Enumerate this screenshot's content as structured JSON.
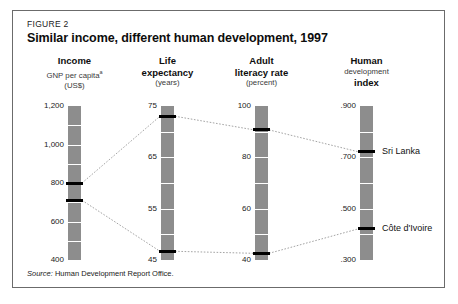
{
  "figure": {
    "label": "FIGURE 2",
    "title": "Similar income, different human development, 1997",
    "source_prefix": "Source:",
    "source_text": "Human Development Report Office."
  },
  "columns": [
    {
      "id": "income",
      "head_main": "Income",
      "head_sub": "GNP per capita",
      "head_sub_marker": "a",
      "head_unit": "(US$)",
      "ticks": [
        "1,200",
        "1,000",
        "800",
        "600",
        "400"
      ],
      "tick_values": [
        1200,
        1000,
        800,
        600,
        400
      ]
    },
    {
      "id": "life-expectancy",
      "head_main": "Life",
      "head_sub": "expectancy",
      "head_sub_marker": "",
      "head_unit": "(years)",
      "ticks": [
        "75",
        "65",
        "55",
        "45"
      ],
      "tick_values": [
        75,
        65,
        55,
        45
      ]
    },
    {
      "id": "adult-literacy",
      "head_main": "Adult",
      "head_sub": "literacy rate",
      "head_sub_marker": "",
      "head_unit": "(percent)",
      "ticks": [
        "100",
        "80",
        "60",
        "40"
      ],
      "tick_values": [
        100,
        80,
        60,
        40
      ]
    },
    {
      "id": "human-development-index",
      "head_main": "Human",
      "head_sub": "development",
      "head_sub_marker": "",
      "head_unit": "index",
      "ticks": [
        ".900",
        ".700",
        ".500",
        ".300"
      ],
      "tick_values": [
        0.9,
        0.7,
        0.5,
        0.3
      ]
    }
  ],
  "countries": [
    {
      "name": "Sri Lanka",
      "income": 800,
      "life_expectancy": 73.0,
      "adult_literacy": 90.7,
      "hdi": 0.721
    },
    {
      "name": "Côte d'Ivoire",
      "income": 710,
      "life_expectancy": 46.7,
      "adult_literacy": 42.6,
      "hdi": 0.422
    }
  ],
  "colors": {
    "bar": "#8d8d8d",
    "marker": "#000000",
    "gridline": "#ffffff",
    "border": "#6b6b6b",
    "connector": "#9a9a9a",
    "text": "#1a1a1a"
  },
  "chart_data": {
    "type": "line",
    "title": "Similar income, different human development, 1997",
    "subtitle": "FIGURE 2",
    "layout": "parallel-coordinates",
    "legend": "none",
    "grid": true,
    "axes": [
      {
        "name": "Income",
        "sublabel": "GNP per capita",
        "unit": "(US$)",
        "range": [
          400,
          1200
        ],
        "ticks": [
          400,
          600,
          800,
          1000,
          1200
        ],
        "ticklabels": [
          "400",
          "600",
          "800",
          "1,000",
          "1,200"
        ]
      },
      {
        "name": "Life expectancy",
        "sublabel": "Life expectancy",
        "unit": "(years)",
        "range": [
          45,
          75
        ],
        "ticks": [
          45,
          55,
          65,
          75
        ],
        "ticklabels": [
          "45",
          "55",
          "65",
          "75"
        ]
      },
      {
        "name": "Adult literacy rate",
        "sublabel": "Adult literacy rate",
        "unit": "(percent)",
        "range": [
          40,
          100
        ],
        "ticks": [
          40,
          60,
          80,
          100
        ],
        "ticklabels": [
          "40",
          "60",
          "80",
          "100"
        ]
      },
      {
        "name": "Human development index",
        "sublabel": "Human development index",
        "unit": "index",
        "range": [
          0.3,
          0.9
        ],
        "ticks": [
          0.3,
          0.5,
          0.7,
          0.9
        ],
        "ticklabels": [
          ".300",
          ".500",
          ".700",
          ".900"
        ]
      }
    ],
    "series": [
      {
        "name": "Sri Lanka",
        "values": [
          800,
          73.0,
          90.7,
          0.721
        ]
      },
      {
        "name": "Côte d'Ivoire",
        "values": [
          710,
          46.7,
          42.6,
          0.422
        ]
      }
    ],
    "annotations": [
      "Source: Human Development Report Office."
    ]
  }
}
